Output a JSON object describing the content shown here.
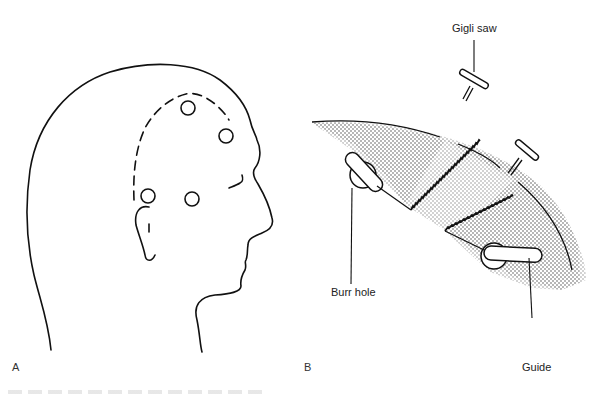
{
  "figure": {
    "panels": [
      {
        "id": "A",
        "letter": "A",
        "subject": "head-profile-with-burr-holes",
        "burr_hole_count": 4
      },
      {
        "id": "B",
        "letter": "B",
        "subject": "gigli-saw-craniotomy-section",
        "labels": {
          "gigli_saw": "Gigli saw",
          "burr_hole": "Burr hole",
          "guide": "Guide"
        }
      }
    ]
  },
  "colors": {
    "ink": "#111111",
    "stipple": "#9a9a9a",
    "background": "#ffffff"
  }
}
